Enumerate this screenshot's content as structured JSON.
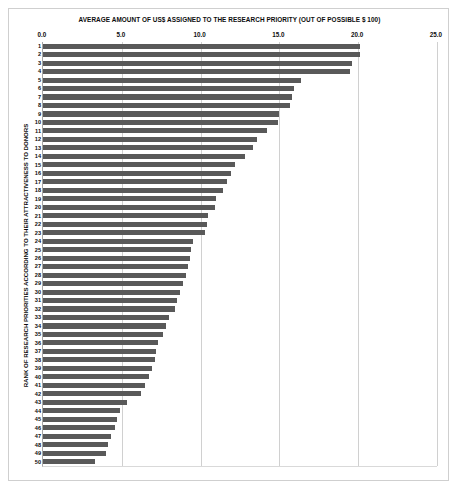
{
  "chart_data": {
    "type": "bar",
    "orientation": "horizontal",
    "title": "AVERAGE AMOUNT OF US$ ASSIGNED TO THE RESEARCH PRIORITY (OUT OF POSSIBLE $ 100)",
    "xlabel": "AVERAGE AMOUNT OF US$ ASSIGNED TO THE RESEARCH PRIORITY (OUT OF POSSIBLE $ 100)",
    "ylabel": "RANK OF RESEARCH PRIORITIES ACCORDING TO THEIR ATTRACTIVENESS TO DONORS",
    "xlim": [
      0.0,
      25.0
    ],
    "xticks": [
      "0.0",
      "5.0",
      "10.0",
      "15.0",
      "20.0",
      "25.0"
    ],
    "xtick_values": [
      0.0,
      5.0,
      10.0,
      15.0,
      20.0,
      25.0
    ],
    "grid": true,
    "legend": false,
    "bar_color": "#595959",
    "gridline_color": "#d0d0d0",
    "categories": [
      "1",
      "2",
      "3",
      "4",
      "5",
      "6",
      "7",
      "8",
      "9",
      "10",
      "11",
      "12",
      "13",
      "14",
      "15",
      "16",
      "17",
      "18",
      "19",
      "20",
      "21",
      "22",
      "23",
      "24",
      "25",
      "26",
      "27",
      "28",
      "29",
      "30",
      "31",
      "32",
      "33",
      "34",
      "35",
      "36",
      "37",
      "38",
      "39",
      "40",
      "41",
      "42",
      "43",
      "44",
      "45",
      "46",
      "47",
      "48",
      "49",
      "50"
    ],
    "values": [
      20.1,
      20.1,
      19.6,
      19.5,
      16.4,
      15.9,
      15.8,
      15.7,
      15.0,
      14.9,
      14.2,
      13.6,
      13.3,
      12.8,
      12.2,
      11.9,
      11.7,
      11.4,
      11.0,
      10.9,
      10.5,
      10.4,
      10.3,
      9.5,
      9.4,
      9.3,
      9.2,
      9.1,
      8.9,
      8.7,
      8.5,
      8.4,
      8.0,
      7.8,
      7.6,
      7.3,
      7.2,
      7.1,
      6.9,
      6.7,
      6.5,
      6.2,
      5.3,
      4.9,
      4.7,
      4.6,
      4.3,
      4.1,
      4.0,
      3.3
    ]
  }
}
